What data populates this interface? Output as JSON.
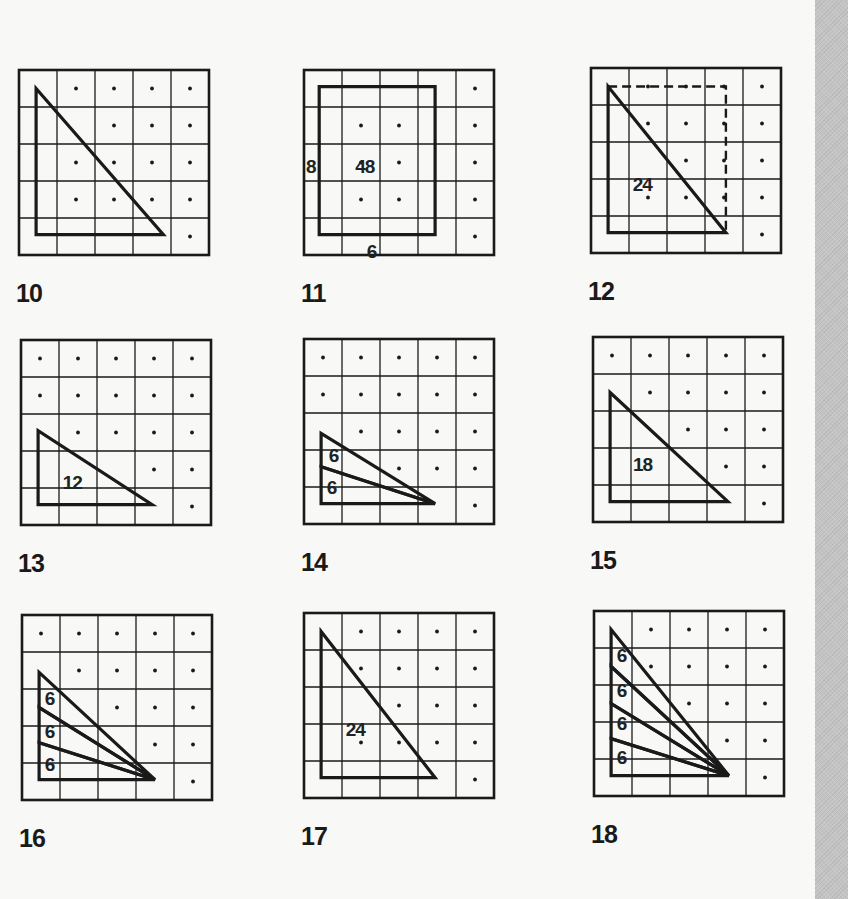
{
  "page": {
    "background": "#f8f8f6",
    "ink": "#1a1a1a",
    "strip_color": "#c4c4c4"
  },
  "grid": {
    "rows": 5,
    "cols": 5
  },
  "panels": [
    {
      "number": "10",
      "dots": [
        [
          0,
          1
        ],
        [
          0,
          2
        ],
        [
          0,
          3
        ],
        [
          0,
          4
        ],
        [
          1,
          2
        ],
        [
          1,
          3
        ],
        [
          1,
          4
        ],
        [
          2,
          1
        ],
        [
          2,
          2
        ],
        [
          2,
          3
        ],
        [
          2,
          4
        ],
        [
          3,
          1
        ],
        [
          3,
          2
        ],
        [
          3,
          3
        ],
        [
          3,
          4
        ],
        [
          4,
          4
        ]
      ],
      "polygons": [
        {
          "points": [
            [
              0.45,
              0.5
            ],
            [
              0.45,
              4.45
            ],
            [
              3.8,
              4.45
            ]
          ]
        }
      ],
      "dashed": [],
      "labels": []
    },
    {
      "number": "11",
      "dots": [
        [
          0,
          4
        ],
        [
          1,
          1
        ],
        [
          1,
          2
        ],
        [
          1,
          4
        ],
        [
          2,
          1
        ],
        [
          2,
          2
        ],
        [
          2,
          4
        ],
        [
          3,
          1
        ],
        [
          3,
          2
        ],
        [
          3,
          4
        ],
        [
          4,
          4
        ]
      ],
      "polygons": [
        {
          "points": [
            [
              0.4,
              0.45
            ],
            [
              3.45,
              0.45
            ],
            [
              3.45,
              4.45
            ],
            [
              0.4,
              4.45
            ]
          ]
        }
      ],
      "dashed": [],
      "labels": [
        {
          "text": "48",
          "x": 1.35,
          "y": 2.4
        },
        {
          "text": "8",
          "x": 0.05,
          "y": 2.4
        },
        {
          "text": "6",
          "x": 1.65,
          "y": 4.7
        }
      ]
    },
    {
      "number": "12",
      "dots": [
        [
          0,
          1
        ],
        [
          0,
          2
        ],
        [
          0,
          3
        ],
        [
          0,
          4
        ],
        [
          1,
          1
        ],
        [
          1,
          2
        ],
        [
          1,
          3
        ],
        [
          1,
          4
        ],
        [
          2,
          2
        ],
        [
          2,
          3
        ],
        [
          2,
          4
        ],
        [
          3,
          1
        ],
        [
          3,
          2
        ],
        [
          3,
          3
        ],
        [
          3,
          4
        ],
        [
          4,
          4
        ]
      ],
      "polygons": [
        {
          "points": [
            [
              0.45,
              0.5
            ],
            [
              0.45,
              4.45
            ],
            [
              3.55,
              4.45
            ]
          ]
        }
      ],
      "dashed": [
        {
          "points": [
            [
              0.45,
              0.5
            ],
            [
              3.55,
              0.5
            ],
            [
              3.55,
              4.45
            ]
          ]
        }
      ],
      "labels": [
        {
          "text": "24",
          "x": 1.1,
          "y": 2.95
        }
      ]
    },
    {
      "number": "13",
      "dots": [
        [
          0,
          0
        ],
        [
          0,
          1
        ],
        [
          0,
          2
        ],
        [
          0,
          3
        ],
        [
          0,
          4
        ],
        [
          1,
          0
        ],
        [
          1,
          1
        ],
        [
          1,
          2
        ],
        [
          1,
          3
        ],
        [
          1,
          4
        ],
        [
          2,
          1
        ],
        [
          2,
          2
        ],
        [
          2,
          3
        ],
        [
          2,
          4
        ],
        [
          3,
          3
        ],
        [
          3,
          4
        ],
        [
          4,
          4
        ]
      ],
      "polygons": [
        {
          "points": [
            [
              0.45,
              2.45
            ],
            [
              0.45,
              4.45
            ],
            [
              3.45,
              4.45
            ]
          ]
        }
      ],
      "dashed": [],
      "labels": [
        {
          "text": "12",
          "x": 1.1,
          "y": 3.65
        }
      ]
    },
    {
      "number": "14",
      "dots": [
        [
          0,
          0
        ],
        [
          0,
          1
        ],
        [
          0,
          2
        ],
        [
          0,
          3
        ],
        [
          0,
          4
        ],
        [
          1,
          0
        ],
        [
          1,
          1
        ],
        [
          1,
          2
        ],
        [
          1,
          3
        ],
        [
          1,
          4
        ],
        [
          2,
          1
        ],
        [
          2,
          2
        ],
        [
          2,
          3
        ],
        [
          2,
          4
        ],
        [
          3,
          2
        ],
        [
          3,
          3
        ],
        [
          3,
          4
        ],
        [
          4,
          4
        ]
      ],
      "polygons": [
        {
          "points": [
            [
              0.45,
              2.55
            ],
            [
              0.45,
              3.45
            ],
            [
              3.45,
              4.45
            ]
          ]
        },
        {
          "points": [
            [
              0.45,
              3.45
            ],
            [
              0.45,
              4.45
            ],
            [
              3.45,
              4.45
            ]
          ]
        }
      ],
      "dashed": [],
      "labels": [
        {
          "text": "6",
          "x": 0.65,
          "y": 2.95
        },
        {
          "text": "6",
          "x": 0.6,
          "y": 3.8
        }
      ]
    },
    {
      "number": "15",
      "dots": [
        [
          0,
          0
        ],
        [
          0,
          1
        ],
        [
          0,
          2
        ],
        [
          0,
          3
        ],
        [
          0,
          4
        ],
        [
          1,
          1
        ],
        [
          1,
          2
        ],
        [
          1,
          3
        ],
        [
          1,
          4
        ],
        [
          2,
          2
        ],
        [
          2,
          3
        ],
        [
          2,
          4
        ],
        [
          3,
          3
        ],
        [
          3,
          4
        ],
        [
          4,
          4
        ]
      ],
      "polygons": [
        {
          "points": [
            [
              0.45,
              1.5
            ],
            [
              0.45,
              4.45
            ],
            [
              3.55,
              4.45
            ]
          ]
        }
      ],
      "dashed": [],
      "labels": [
        {
          "text": "18",
          "x": 1.05,
          "y": 3.25
        }
      ]
    },
    {
      "number": "16",
      "dots": [
        [
          0,
          0
        ],
        [
          0,
          1
        ],
        [
          0,
          2
        ],
        [
          0,
          3
        ],
        [
          0,
          4
        ],
        [
          1,
          1
        ],
        [
          1,
          2
        ],
        [
          1,
          3
        ],
        [
          1,
          4
        ],
        [
          2,
          2
        ],
        [
          2,
          3
        ],
        [
          2,
          4
        ],
        [
          3,
          3
        ],
        [
          3,
          4
        ],
        [
          4,
          4
        ]
      ],
      "polygons": [
        {
          "points": [
            [
              0.45,
              1.55
            ],
            [
              0.45,
              2.5
            ],
            [
              3.5,
              4.45
            ]
          ]
        },
        {
          "points": [
            [
              0.45,
              2.5
            ],
            [
              0.45,
              3.45
            ],
            [
              3.5,
              4.45
            ]
          ]
        },
        {
          "points": [
            [
              0.45,
              3.45
            ],
            [
              0.45,
              4.45
            ],
            [
              3.5,
              4.45
            ]
          ]
        }
      ],
      "dashed": [],
      "labels": [
        {
          "text": "6",
          "x": 0.6,
          "y": 2.05
        },
        {
          "text": "6",
          "x": 0.6,
          "y": 2.95
        },
        {
          "text": "6",
          "x": 0.6,
          "y": 3.85
        }
      ]
    },
    {
      "number": "17",
      "dots": [
        [
          0,
          1
        ],
        [
          0,
          2
        ],
        [
          0,
          3
        ],
        [
          0,
          4
        ],
        [
          1,
          1
        ],
        [
          1,
          2
        ],
        [
          1,
          3
        ],
        [
          1,
          4
        ],
        [
          2,
          2
        ],
        [
          2,
          3
        ],
        [
          2,
          4
        ],
        [
          3,
          1
        ],
        [
          3,
          2
        ],
        [
          3,
          3
        ],
        [
          3,
          4
        ],
        [
          4,
          4
        ]
      ],
      "polygons": [
        {
          "points": [
            [
              0.45,
              0.5
            ],
            [
              0.45,
              4.45
            ],
            [
              3.45,
              4.45
            ]
          ]
        }
      ],
      "dashed": [],
      "labels": [
        {
          "text": "24",
          "x": 1.1,
          "y": 2.95
        }
      ]
    },
    {
      "number": "18",
      "dots": [
        [
          0,
          1
        ],
        [
          0,
          2
        ],
        [
          0,
          3
        ],
        [
          0,
          4
        ],
        [
          1,
          1
        ],
        [
          1,
          2
        ],
        [
          1,
          3
        ],
        [
          1,
          4
        ],
        [
          2,
          2
        ],
        [
          2,
          3
        ],
        [
          2,
          4
        ],
        [
          3,
          3
        ],
        [
          3,
          4
        ],
        [
          4,
          4
        ]
      ],
      "polygons": [
        {
          "points": [
            [
              0.45,
              0.5
            ],
            [
              0.45,
              1.5
            ],
            [
              3.55,
              4.45
            ]
          ]
        },
        {
          "points": [
            [
              0.45,
              1.5
            ],
            [
              0.45,
              2.5
            ],
            [
              3.55,
              4.45
            ]
          ]
        },
        {
          "points": [
            [
              0.45,
              2.5
            ],
            [
              0.45,
              3.45
            ],
            [
              3.55,
              4.45
            ]
          ]
        },
        {
          "points": [
            [
              0.45,
              3.45
            ],
            [
              0.45,
              4.45
            ],
            [
              3.55,
              4.45
            ]
          ]
        }
      ],
      "dashed": [],
      "labels": [
        {
          "text": "6",
          "x": 0.6,
          "y": 1.0
        },
        {
          "text": "6",
          "x": 0.6,
          "y": 1.95
        },
        {
          "text": "6",
          "x": 0.6,
          "y": 2.85
        },
        {
          "text": "6",
          "x": 0.6,
          "y": 3.75
        }
      ]
    }
  ]
}
